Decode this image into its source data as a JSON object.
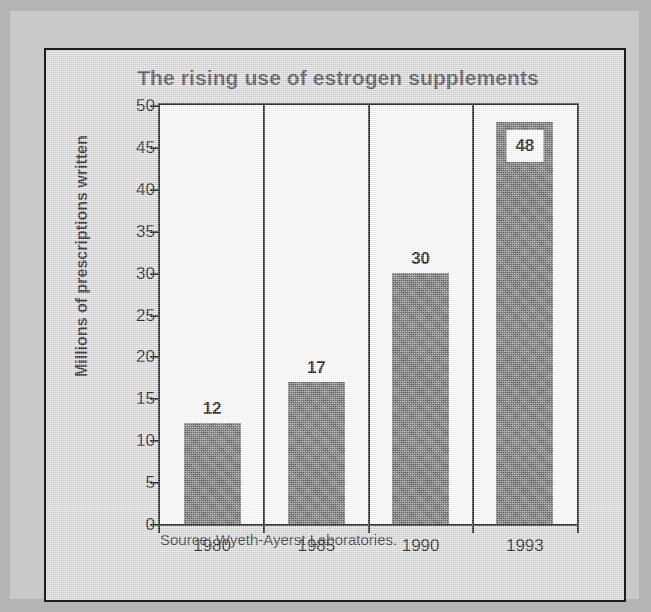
{
  "chart_data": {
    "type": "bar",
    "title": "The rising use of estrogen supplements",
    "xlabel": "",
    "ylabel": "Millions of prescriptions written",
    "categories": [
      "1980",
      "1985",
      "1990",
      "1993"
    ],
    "values": [
      12,
      17,
      30,
      48
    ],
    "value_labels": [
      "12",
      "17",
      "30",
      "48"
    ],
    "ylim": [
      0,
      50
    ],
    "yticks": [
      0,
      5,
      10,
      15,
      20,
      25,
      30,
      35,
      40,
      45,
      50
    ],
    "ytick_labels": [
      "0",
      "5",
      "10",
      "15",
      "20",
      "25",
      "30",
      "35",
      "40",
      "45",
      "50"
    ],
    "grid": false,
    "legend": null,
    "annotations": [
      "Source: Wyeth-Ayerst Laboratories."
    ],
    "series": [
      {
        "name": "Prescriptions written",
        "values": [
          12,
          17,
          30,
          48
        ]
      }
    ]
  },
  "source": {
    "text": "Source: Wyeth-Ayerst Laboratories."
  },
  "colors": {
    "bar_fill": "#6c6c6c",
    "panel_background": "#dcdcdc",
    "plot_background": "#ffffff",
    "axis": "#1d1d1d",
    "title_text": "#4e4e4e",
    "mat": "#c9c9c9"
  }
}
